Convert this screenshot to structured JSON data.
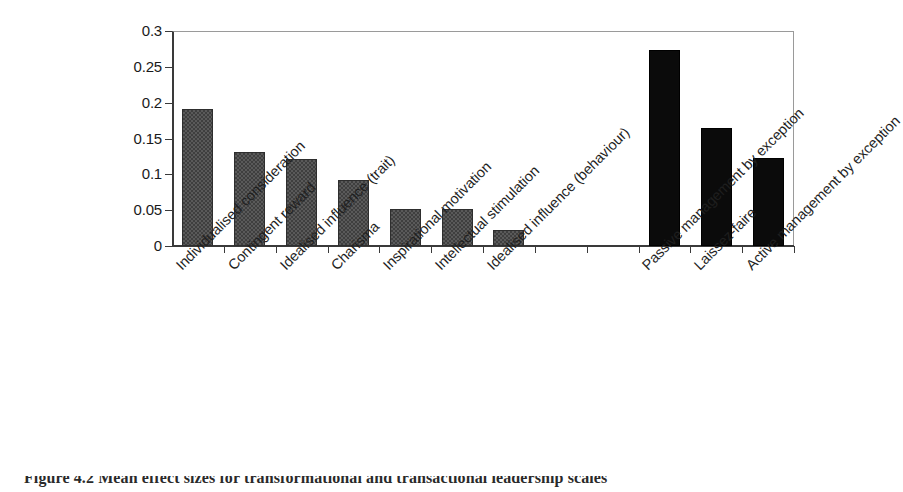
{
  "chart_data": {
    "type": "bar",
    "title": "",
    "xlabel": "",
    "ylabel": "",
    "ylim": [
      0,
      0.3
    ],
    "grid": false,
    "legend": "none",
    "ytick_labels": [
      "0.3",
      "0.25",
      "0.2",
      "0.15",
      "0.1",
      "0.05",
      "0"
    ],
    "ytick_values": [
      0.3,
      0.25,
      0.2,
      0.15,
      0.1,
      0.05,
      0
    ],
    "categories": [
      "Individualised consideration",
      "Contingent reward",
      "Idealised influence (trait)",
      "Charisma",
      "Inspirational motivation",
      "Intellectual stimulation",
      "Idealised influence (behaviour)",
      "",
      "",
      "Passive management by exception",
      "Laissez-faire",
      "Active management by exception"
    ],
    "values": [
      0.191,
      0.131,
      0.121,
      0.092,
      0.052,
      0.052,
      0.022,
      null,
      null,
      0.273,
      0.164,
      0.123
    ],
    "bar_colors": [
      "#3f3f3f",
      "#3f3f3f",
      "#3f3f3f",
      "#3f3f3f",
      "#3f3f3f",
      "#3f3f3f",
      "#3f3f3f",
      null,
      null,
      "#0b0b0b",
      "#0b0b0b",
      "#0b0b0b"
    ],
    "label_rotation": -45
  },
  "caption": {
    "text": "Figure 4.2  Mean effect sizes for transformational and transactional leadership scales"
  },
  "axis": {
    "y_axis_color": "#3a3a3a",
    "x_axis_color": "#3a3a3a",
    "frame_color": "#9a9a9a"
  }
}
